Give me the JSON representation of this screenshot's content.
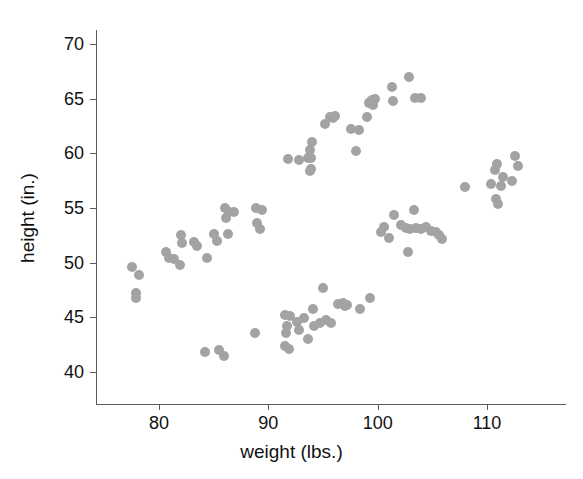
{
  "chart_data": {
    "type": "scatter",
    "title": "",
    "xlabel": "weight (lbs.)",
    "ylabel": "height (in.)",
    "xlim": [
      73.5,
      116.5
    ],
    "ylim": [
      37.0,
      71.5
    ],
    "xticks": [
      80,
      90,
      100,
      110
    ],
    "yticks": [
      40,
      45,
      50,
      55,
      60,
      65,
      70
    ],
    "grid": false,
    "legend": null,
    "marker": {
      "shape": "circle",
      "color": "#a3a3a3",
      "size_px": 10
    },
    "series": [
      {
        "name": "observations",
        "points": [
          [
            77.5,
            49.6
          ],
          [
            78.2,
            48.9
          ],
          [
            77.9,
            47.2
          ],
          [
            77.9,
            46.8
          ],
          [
            80.6,
            51.0
          ],
          [
            80.9,
            50.4
          ],
          [
            81.4,
            50.3
          ],
          [
            81.9,
            49.8
          ],
          [
            82.0,
            52.5
          ],
          [
            82.1,
            51.8
          ],
          [
            83.2,
            51.9
          ],
          [
            83.5,
            51.5
          ],
          [
            84.4,
            50.4
          ],
          [
            85.0,
            52.6
          ],
          [
            85.3,
            52.0
          ],
          [
            86.3,
            52.6
          ],
          [
            86.0,
            55.0
          ],
          [
            86.4,
            54.6
          ],
          [
            86.1,
            54.1
          ],
          [
            86.9,
            54.6
          ],
          [
            88.9,
            55.0
          ],
          [
            89.4,
            54.8
          ],
          [
            89.0,
            53.6
          ],
          [
            89.2,
            53.1
          ],
          [
            91.8,
            59.5
          ],
          [
            92.8,
            59.4
          ],
          [
            93.6,
            59.6
          ],
          [
            93.8,
            60.3
          ],
          [
            94.0,
            61.0
          ],
          [
            93.9,
            59.6
          ],
          [
            93.9,
            58.6
          ],
          [
            93.8,
            58.4
          ],
          [
            95.6,
            63.3
          ],
          [
            95.9,
            63.2
          ],
          [
            95.2,
            62.7
          ],
          [
            96.1,
            63.4
          ],
          [
            97.6,
            62.2
          ],
          [
            98.3,
            62.1
          ],
          [
            98.0,
            60.2
          ],
          [
            99.0,
            63.3
          ],
          [
            99.3,
            64.7
          ],
          [
            99.5,
            64.9
          ],
          [
            99.8,
            65.0
          ],
          [
            99.2,
            64.6
          ],
          [
            99.6,
            64.4
          ],
          [
            101.3,
            66.1
          ],
          [
            101.4,
            64.8
          ],
          [
            102.9,
            67.0
          ],
          [
            103.4,
            65.1
          ],
          [
            104.0,
            65.1
          ],
          [
            100.3,
            52.8
          ],
          [
            100.6,
            53.3
          ],
          [
            101.0,
            52.3
          ],
          [
            101.5,
            54.4
          ],
          [
            102.1,
            53.4
          ],
          [
            102.6,
            53.2
          ],
          [
            103.0,
            53.1
          ],
          [
            103.3,
            54.8
          ],
          [
            103.5,
            53.2
          ],
          [
            104.0,
            53.1
          ],
          [
            104.4,
            53.3
          ],
          [
            104.9,
            52.9
          ],
          [
            105.3,
            52.8
          ],
          [
            105.6,
            52.5
          ],
          [
            105.9,
            52.2
          ],
          [
            102.8,
            51.0
          ],
          [
            108.0,
            56.9
          ],
          [
            110.4,
            57.2
          ],
          [
            110.7,
            58.5
          ],
          [
            110.9,
            59.0
          ],
          [
            111.3,
            57.0
          ],
          [
            111.5,
            57.8
          ],
          [
            110.8,
            55.8
          ],
          [
            111.0,
            55.4
          ],
          [
            112.3,
            57.5
          ],
          [
            112.6,
            59.8
          ],
          [
            112.8,
            58.8
          ],
          [
            84.2,
            41.8
          ],
          [
            85.5,
            42.0
          ],
          [
            85.9,
            41.5
          ],
          [
            88.8,
            43.6
          ],
          [
            91.5,
            45.2
          ],
          [
            92.0,
            45.1
          ],
          [
            91.7,
            44.2
          ],
          [
            91.6,
            43.6
          ],
          [
            91.5,
            42.4
          ],
          [
            91.9,
            42.1
          ],
          [
            92.6,
            44.6
          ],
          [
            92.8,
            43.8
          ],
          [
            93.3,
            44.9
          ],
          [
            93.6,
            43.0
          ],
          [
            94.1,
            45.8
          ],
          [
            94.2,
            44.2
          ],
          [
            94.7,
            44.5
          ],
          [
            95.0,
            47.7
          ],
          [
            95.3,
            44.8
          ],
          [
            95.7,
            44.5
          ],
          [
            96.4,
            46.2
          ],
          [
            96.8,
            46.3
          ],
          [
            97.0,
            46.0
          ],
          [
            97.2,
            46.1
          ],
          [
            98.4,
            45.8
          ],
          [
            99.3,
            46.8
          ]
        ]
      }
    ]
  },
  "axes": {
    "x_tick_labels": [
      "80",
      "90",
      "100",
      "110"
    ],
    "y_tick_labels": [
      "40",
      "45",
      "50",
      "55",
      "60",
      "65",
      "70"
    ]
  }
}
